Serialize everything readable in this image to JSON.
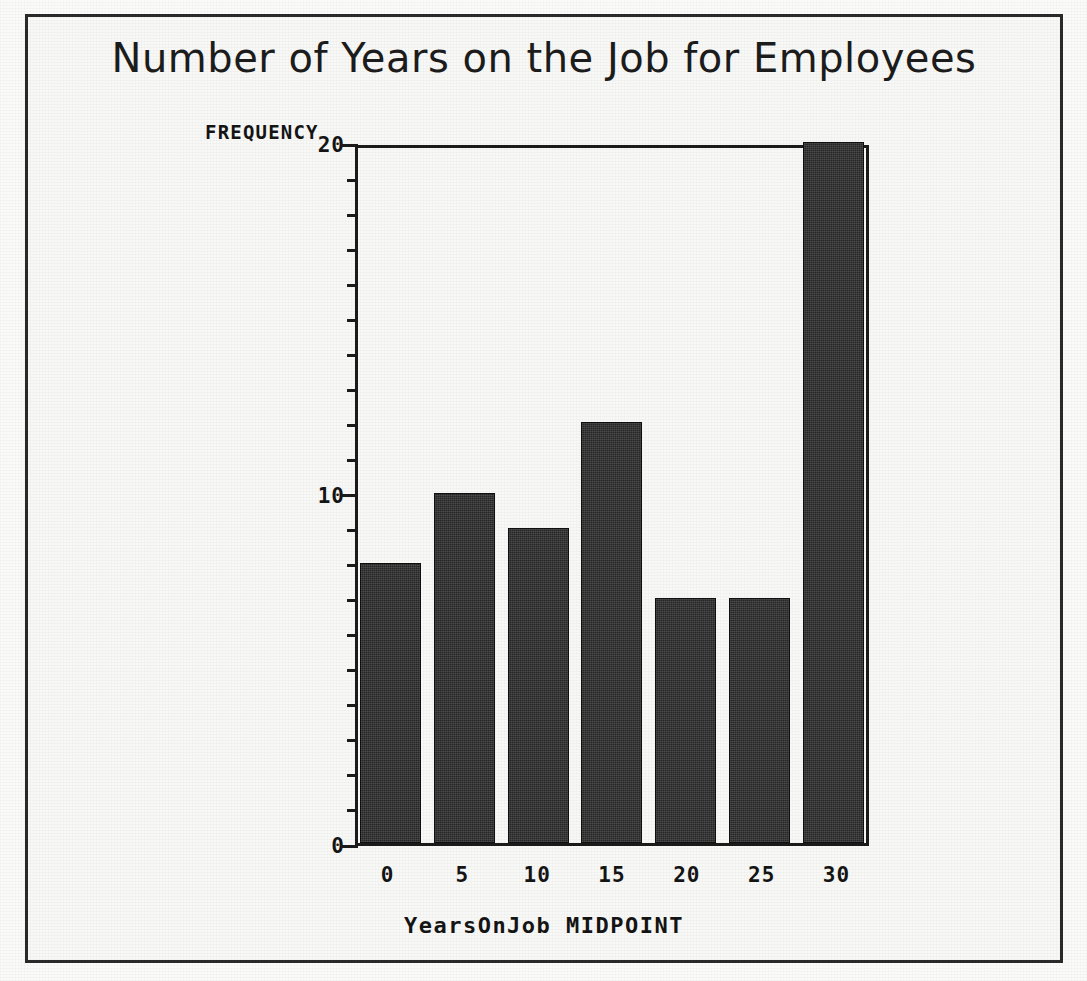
{
  "chart_data": {
    "type": "bar",
    "title": "Number of Years on the Job for Employees",
    "xlabel": "YearsOnJob MIDPOINT",
    "ylabel": "FREQUENCY",
    "categories": [
      "0",
      "5",
      "10",
      "15",
      "20",
      "25",
      "30"
    ],
    "values": [
      8,
      10,
      9,
      12,
      7,
      7,
      20
    ],
    "ylim": [
      0,
      20
    ],
    "y_major_ticks": [
      "0",
      "10",
      "20"
    ],
    "y_major_tick_values": [
      0,
      10,
      20
    ],
    "y_minor_tick_step": 1,
    "grid": false,
    "legend": null,
    "bar_color": "#262626",
    "axis_color": "#1b1b1b",
    "background_color": "#f8f8f6"
  },
  "figure": {
    "frame_border_color": "#2a2a2a"
  }
}
